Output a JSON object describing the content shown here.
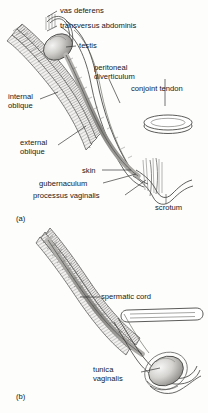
{
  "figure": {
    "title_visible": false,
    "background_color": "#fdfdfc",
    "ink_color": "#16181a",
    "panels": [
      {
        "id": "a",
        "id_label": "(a)",
        "description": "descent of the testis through the inguinal canal, fetal stage"
      },
      {
        "id": "b",
        "id_label": "(b)",
        "description": "testis descended into scrotum with obliterated processus vaginalis"
      }
    ]
  },
  "panel_a": {
    "labels": [
      {
        "key": "vas_deferens",
        "text": "vas deferens"
      },
      {
        "key": "transversus_abdominis",
        "text": "transversus abdominis"
      },
      {
        "key": "testis",
        "text": "testis"
      },
      {
        "key": "peritoneal_diverticulum",
        "text": "peritoneal\ndiverticulum"
      },
      {
        "key": "conjoint_tendon",
        "text": "conjoint tendon"
      },
      {
        "key": "internal_oblique",
        "text": "internal\noblique"
      },
      {
        "key": "external_oblique",
        "text": "external\noblique"
      },
      {
        "key": "skin",
        "text": "skin"
      },
      {
        "key": "gubernaculum",
        "text": "gubernaculum"
      },
      {
        "key": "processus_vaginalis",
        "text": "processus vaginalis"
      },
      {
        "key": "scrotum",
        "text": "scrotum"
      }
    ],
    "text": {
      "vas_deferens": "vas deferens",
      "transversus_abdominis": "transversus abdominis",
      "testis": "testis",
      "peritoneal_diverticulum_line1": "peritoneal",
      "peritoneal_diverticulum_line2": "diverticulum",
      "conjoint_tendon": "conjoint tendon",
      "internal_oblique_line1": "internal",
      "internal_oblique_line2": "oblique",
      "external_oblique_line1": "external",
      "external_oblique_line2": "oblique",
      "skin": "skin",
      "gubernaculum": "gubernaculum",
      "processus_vaginalis": "processus vaginalis",
      "scrotum": "scrotum",
      "panel_id": "(a)"
    }
  },
  "panel_b": {
    "labels": [
      {
        "key": "spermatic_cord",
        "text": "spermatic cord"
      },
      {
        "key": "tunica_vaginalis",
        "text": "tunica\nvaginalis"
      }
    ],
    "text": {
      "spermatic_cord": "spermatic cord",
      "tunica_vaginalis_line1": "tunica",
      "tunica_vaginalis_line2": "vaginalis",
      "panel_id": "(b)"
    }
  }
}
